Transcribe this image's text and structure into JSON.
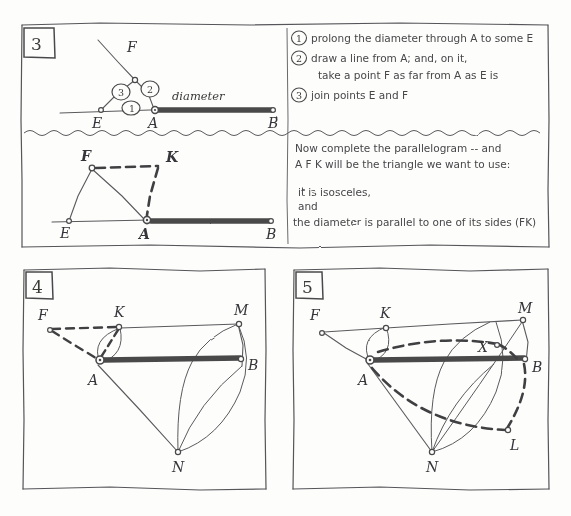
{
  "page": {
    "background_color": "#fdfdfb",
    "ink_color": "#4a4a4c",
    "diameter_color": "#4a4a4a"
  },
  "panels": [
    {
      "number": "3",
      "diagram_top": {
        "labels": [
          "F",
          "E",
          "A",
          "B"
        ],
        "step_markers": [
          "1",
          "2",
          "3"
        ],
        "diameter_label": "diameter"
      },
      "diagram_bottom": {
        "labels": [
          "F",
          "K",
          "E",
          "A",
          "B"
        ]
      },
      "instructions": [
        {
          "marker": "1",
          "lines": [
            "prolong the diameter through A to some E"
          ]
        },
        {
          "marker": "2",
          "lines": [
            "draw a line from A; and, on it,",
            "take a point F as far from A as E is"
          ]
        },
        {
          "marker": "3",
          "lines": [
            "join points E and F"
          ]
        }
      ],
      "note_lines": [
        "Now complete the parallelogram -- and",
        "A F K will be the triangle we want to use:",
        "it is isosceles,",
        "and",
        "the diameter is parallel to one of its sides (FK)"
      ]
    },
    {
      "number": "4",
      "labels": [
        "F",
        "K",
        "M",
        "A",
        "B",
        "N"
      ]
    },
    {
      "number": "5",
      "labels": [
        "F",
        "K",
        "M",
        "A",
        "X",
        "B",
        "L",
        "N"
      ]
    }
  ]
}
